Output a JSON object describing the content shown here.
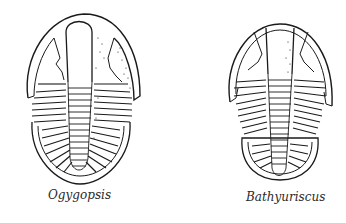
{
  "figures": [
    {
      "id": "ogygopsis",
      "caption": "Ogygopsis",
      "subject": "trilobite-illustration"
    },
    {
      "id": "bathyuriscus",
      "caption": "Bathyuriscus",
      "subject": "trilobite-illustration"
    }
  ],
  "colors": {
    "ink": "#1a1a1a",
    "paper": "#ffffff"
  }
}
